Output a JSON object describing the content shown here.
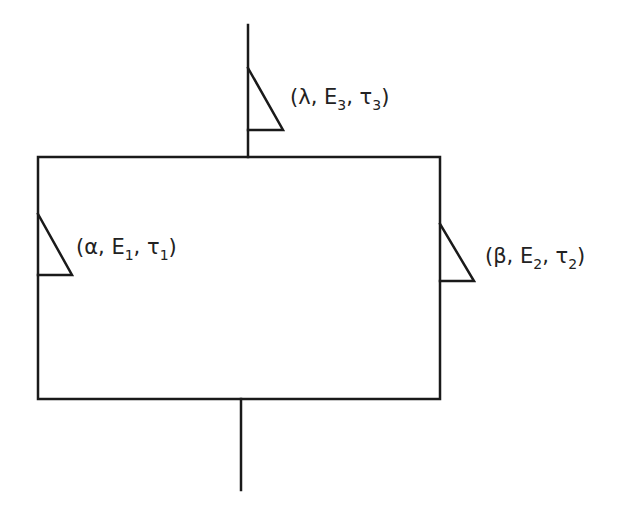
{
  "diagram": {
    "stroke_color": "#1a1a1a",
    "background": "#ffffff",
    "block": {
      "shape": "rectangle"
    },
    "labels": {
      "top": {
        "open": "(",
        "p": "λ",
        "sep1": ", ",
        "E": "E",
        "E_sub": "3",
        "sep2": ", ",
        "t": "τ",
        "t_sub": "3",
        "close": ")"
      },
      "left": {
        "open": "(",
        "p": "α",
        "sep1": ", ",
        "E": "E",
        "E_sub": "1",
        "sep2": ", ",
        "t": "τ",
        "t_sub": "1",
        "close": ")"
      },
      "right": {
        "open": "(",
        "p": "β",
        "sep1": ", ",
        "E": "E",
        "E_sub": "2",
        "sep2": ", ",
        "t": "τ",
        "t_sub": "2",
        "close": ")"
      }
    }
  }
}
